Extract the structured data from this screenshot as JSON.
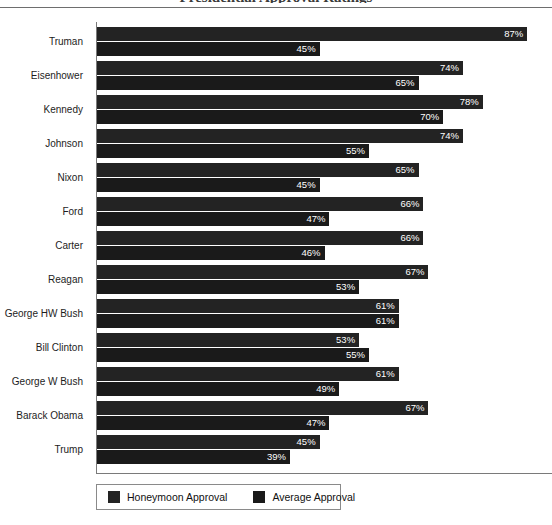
{
  "title_remnant": "Presidential Approval Ratings",
  "chart_data": {
    "type": "bar",
    "orientation": "horizontal",
    "title": "Presidential Approval Ratings",
    "xlabel": "",
    "ylabel": "",
    "xlim": [
      0,
      92
    ],
    "grid": false,
    "legend_position": "bottom-left",
    "value_suffix": "%",
    "categories": [
      "Truman",
      "Eisenhower",
      "Kennedy",
      "Johnson",
      "Nixon",
      "Ford",
      "Carter",
      "Reagan",
      "George HW Bush",
      "Bill Clinton",
      "George W Bush",
      "Barack Obama",
      "Trump"
    ],
    "series": [
      {
        "name": "Honeymoon Approval",
        "color": "#232323",
        "values": [
          87,
          74,
          78,
          74,
          65,
          66,
          66,
          67,
          61,
          53,
          61,
          67,
          45
        ],
        "labels": [
          "87%",
          "74%",
          "78%",
          "74%",
          "65%",
          "66%",
          "66%",
          "67%",
          "61%",
          "53%",
          "61%",
          "67%",
          "45%"
        ]
      },
      {
        "name": "Average Approval",
        "color": "#1a1a1a",
        "values": [
          45,
          65,
          70,
          55,
          45,
          47,
          46,
          53,
          61,
          55,
          49,
          47,
          39
        ],
        "labels": [
          "45%",
          "65%",
          "70%",
          "55%",
          "45%",
          "47%",
          "46%",
          "53%",
          "61%",
          "55%",
          "49%",
          "47%",
          "39%"
        ]
      }
    ]
  },
  "legend": {
    "items": [
      {
        "label": "Honeymoon Approval"
      },
      {
        "label": "Average Approval"
      }
    ]
  }
}
